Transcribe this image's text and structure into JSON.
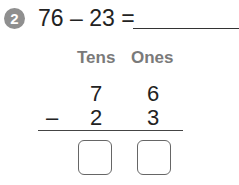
{
  "problem": {
    "number": "2",
    "expression": "76 – 23 =",
    "answer": ""
  },
  "columns": {
    "tens_label": "Tens",
    "ones_label": "Ones"
  },
  "vertical": {
    "top": {
      "tens": "7",
      "ones": "6"
    },
    "operator": "–",
    "bottom": {
      "tens": "2",
      "ones": "3"
    },
    "result": {
      "tens": "",
      "ones": ""
    }
  },
  "colors": {
    "badge": "#8f8f8f",
    "header_text": "#7a7a7a",
    "text": "#222222"
  }
}
